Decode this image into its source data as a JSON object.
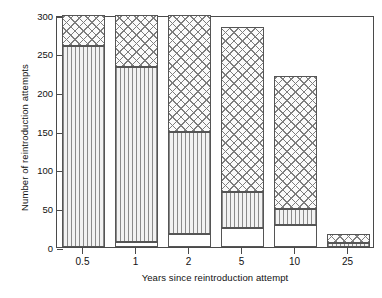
{
  "chart_data": {
    "type": "bar",
    "title": "",
    "subtitle": "",
    "xlabel": "Years since reintroduction attempt",
    "ylabel": "Number of reintroduction attempts",
    "categories": [
      "0.5",
      "1",
      "2",
      "5",
      "10",
      "25"
    ],
    "xtick_labels": [
      "0.5",
      "1",
      "2",
      "5",
      "10",
      "25"
    ],
    "ytick_labels": [
      "0",
      "50",
      "100",
      "150",
      "200",
      "250",
      "300"
    ],
    "ytick_values": [
      0,
      50,
      100,
      150,
      200,
      250,
      300
    ],
    "ylim": [
      0,
      300
    ],
    "grid": false,
    "legend": "none",
    "stacked": true,
    "series": [
      {
        "name": "blank",
        "pattern": "blank",
        "values": [
          0,
          6,
          17,
          25,
          29,
          0
        ]
      },
      {
        "name": "vertical-lines",
        "pattern": "vertical-lines",
        "values": [
          260,
          227,
          132,
          46,
          20,
          5
        ]
      },
      {
        "name": "crosshatch",
        "pattern": "crosshatch",
        "values": [
          40,
          67,
          151,
          214,
          172,
          12
        ]
      }
    ],
    "bar_totals": [
      300,
      300,
      300,
      285,
      221,
      17
    ],
    "cumulative_boundaries": [
      [
        0,
        260,
        300
      ],
      [
        6,
        233,
        300
      ],
      [
        17,
        149,
        300
      ],
      [
        25,
        71,
        285
      ],
      [
        29,
        49,
        221
      ],
      [
        0,
        5,
        17
      ]
    ],
    "annotations": []
  },
  "colors": {
    "axis": "#4a4a4a",
    "text": "#111111",
    "hatch": "#7d7d7d",
    "background": "#ffffff"
  }
}
